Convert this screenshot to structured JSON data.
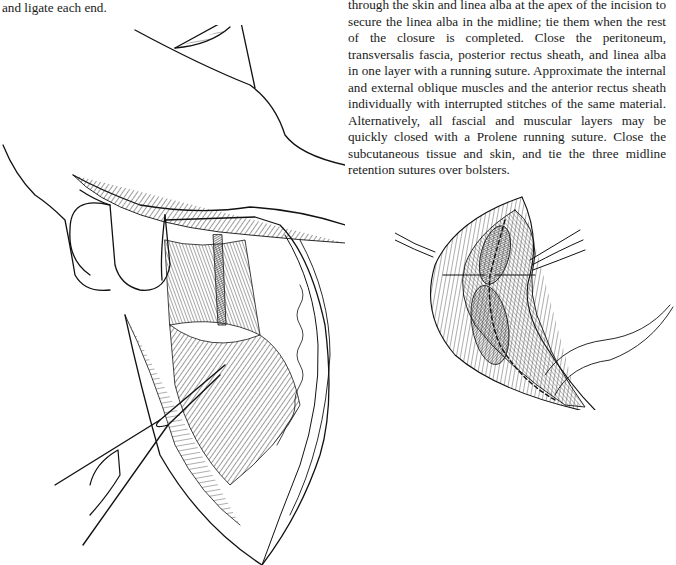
{
  "page": {
    "left_column": {
      "text": "and ligate each end."
    },
    "right_column": {
      "text": "through the skin and linea alba at the apex of the incision to secure the linea alba in the midline; tie them when the rest of the closure is completed. Close the peritoneum, transversalis fascia, posterior rectus sheath, and linea alba in one layer with a running suture. Approximate the internal and external oblique muscles and the anterior rectus sheath individually with interrupted stitches of the same material. Alternatively, all fascial and muscular layers may be quickly closed with a Prolene running suture. Close the subcutaneous tissue and skin, and tie the three midline retention sutures over bolsters."
    },
    "figures": [
      {
        "id": "left",
        "subject": "surgical-illustration-retracted-abdominal-incision-with-hand-and-instrument"
      },
      {
        "id": "right",
        "subject": "surgical-illustration-layered-closure-with-retention-sutures"
      }
    ]
  }
}
